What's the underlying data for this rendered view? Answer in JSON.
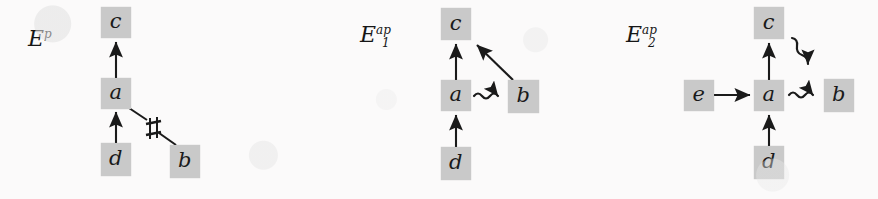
{
  "figure": {
    "type": "diagram",
    "background_color": "#fbfafa",
    "node_fill_color": "#c9c9c9",
    "ink_color": "#1a1a1a",
    "width": 878,
    "height": 199
  },
  "panels": [
    {
      "id": "panel-ep",
      "label": {
        "base": "E",
        "superscript": "p",
        "subscript": "",
        "text": "E^p"
      },
      "label_pos": {
        "x": 28,
        "y": 28
      },
      "nodes": [
        {
          "id": "c",
          "label": "c",
          "x": 101,
          "y": 7,
          "w": 30,
          "h": 31
        },
        {
          "id": "a",
          "label": "a",
          "x": 101,
          "y": 78,
          "w": 30,
          "h": 31
        },
        {
          "id": "d",
          "label": "d",
          "x": 101,
          "y": 143,
          "w": 30,
          "h": 33
        },
        {
          "id": "b",
          "label": "b",
          "x": 170,
          "y": 145,
          "w": 30,
          "h": 33
        }
      ],
      "edges": [
        {
          "from": "a",
          "to": "c",
          "style": "arrow",
          "kind": "causal"
        },
        {
          "from": "d",
          "to": "a",
          "style": "arrow",
          "kind": "causal"
        },
        {
          "from": "a",
          "to": "b",
          "style": "barred-line",
          "kind": "conflict",
          "marker": "sharp-bar"
        }
      ]
    },
    {
      "id": "panel-e1ap",
      "label": {
        "base": "E",
        "superscript": "ap",
        "subscript": "1",
        "text": "E_1^{ap}"
      },
      "label_pos": {
        "x": 360,
        "y": 24
      },
      "nodes": [
        {
          "id": "c",
          "label": "c",
          "x": 441,
          "y": 8,
          "w": 30,
          "h": 32
        },
        {
          "id": "a",
          "label": "a",
          "x": 441,
          "y": 80,
          "w": 30,
          "h": 31
        },
        {
          "id": "d",
          "label": "d",
          "x": 441,
          "y": 147,
          "w": 30,
          "h": 33
        },
        {
          "id": "b",
          "label": "b",
          "x": 508,
          "y": 80,
          "w": 31,
          "h": 33
        }
      ],
      "edges": [
        {
          "from": "a",
          "to": "c",
          "style": "arrow",
          "kind": "causal"
        },
        {
          "from": "d",
          "to": "a",
          "style": "arrow",
          "kind": "causal"
        },
        {
          "from": "b",
          "to": "c",
          "style": "arrow",
          "kind": "causal"
        },
        {
          "from": "a",
          "to": "b",
          "style": "squiggly-arrow",
          "kind": "asymmetric-conflict"
        }
      ]
    },
    {
      "id": "panel-e2ap",
      "label": {
        "base": "E",
        "superscript": "ap",
        "subscript": "2",
        "text": "E_2^{ap}"
      },
      "label_pos": {
        "x": 626,
        "y": 24
      },
      "nodes": [
        {
          "id": "c",
          "label": "c",
          "x": 754,
          "y": 7,
          "w": 30,
          "h": 32
        },
        {
          "id": "e",
          "label": "e",
          "x": 684,
          "y": 80,
          "w": 30,
          "h": 31
        },
        {
          "id": "a",
          "label": "a",
          "x": 754,
          "y": 80,
          "w": 30,
          "h": 31
        },
        {
          "id": "b",
          "label": "b",
          "x": 824,
          "y": 79,
          "w": 30,
          "h": 33
        },
        {
          "id": "d",
          "label": "d",
          "x": 754,
          "y": 146,
          "w": 30,
          "h": 33
        }
      ],
      "edges": [
        {
          "from": "a",
          "to": "c",
          "style": "arrow",
          "kind": "causal"
        },
        {
          "from": "d",
          "to": "a",
          "style": "arrow",
          "kind": "causal"
        },
        {
          "from": "e",
          "to": "a",
          "style": "arrow",
          "kind": "causal"
        },
        {
          "from": "a",
          "to": "b",
          "style": "squiggly-arrow",
          "kind": "asymmetric-conflict"
        },
        {
          "from": "c",
          "to": "b",
          "style": "squiggly-arrow-diagonal",
          "kind": "asymmetric-conflict"
        }
      ]
    }
  ]
}
